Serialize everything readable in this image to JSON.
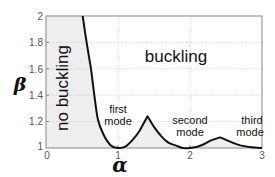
{
  "chart_data": {
    "type": "line",
    "title": "",
    "xlabel": "α",
    "ylabel": "β",
    "xlim": [
      0,
      3
    ],
    "ylim": [
      1,
      2
    ],
    "grid": true,
    "x_ticks": [
      "0",
      "1",
      "2",
      "3"
    ],
    "y_ticks": [
      "1",
      "1.2",
      "1.4",
      "1.6",
      "1.8",
      "2"
    ],
    "series": [
      {
        "name": "stability boundary",
        "x": [
          0.51,
          0.55,
          0.6,
          0.625,
          0.667,
          0.72,
          0.8,
          0.9,
          1.0,
          1.1,
          1.2,
          1.3,
          1.41,
          1.5,
          1.6,
          1.7,
          1.8,
          1.9,
          2.0,
          2.1,
          2.2,
          2.3,
          2.42,
          2.55,
          2.7,
          2.85,
          3.0
        ],
        "values": [
          2.0,
          1.85,
          1.68,
          1.6,
          1.42,
          1.22,
          1.1,
          1.02,
          1.0,
          1.01,
          1.06,
          1.13,
          1.24,
          1.16,
          1.09,
          1.04,
          1.02,
          1.0,
          1.0,
          1.01,
          1.03,
          1.06,
          1.08,
          1.05,
          1.02,
          1.005,
          1.0
        ]
      }
    ],
    "annotations": [
      {
        "text": "no buckling",
        "rotation": -90
      },
      {
        "text": "buckling"
      },
      {
        "text": "first mode"
      },
      {
        "text": "second mode"
      },
      {
        "text": "third mode"
      }
    ]
  },
  "labels": {
    "no_buckling": "no buckling",
    "buckling": "buckling",
    "first_line1": "first",
    "first_line2": "mode",
    "second_line1": "second",
    "second_line2": "mode",
    "third_line1": "third",
    "third_line2": "mode",
    "x_axis": "α",
    "y_axis": "β"
  },
  "ticks": {
    "x": [
      "0",
      "1",
      "2",
      "3"
    ],
    "y": [
      "1",
      "1.2",
      "1.4",
      "1.6",
      "1.8",
      "2"
    ]
  },
  "colors": {
    "curve": "#111111",
    "shade": "#eeeeee",
    "grid": "#bbbbbb",
    "axes": "#888888"
  }
}
